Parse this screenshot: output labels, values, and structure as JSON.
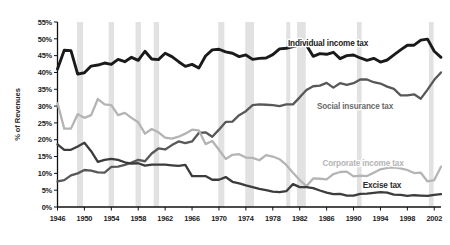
{
  "chart_data": {
    "type": "line",
    "title": "",
    "xlabel": "",
    "ylabel": "% of Revenues",
    "xlim": [
      1946,
      2003
    ],
    "ylim": [
      0,
      55
    ],
    "ytick_labels": [
      "0%",
      "5%",
      "10%",
      "15%",
      "20%",
      "25%",
      "30%",
      "35%",
      "40%",
      "45%",
      "50%",
      "55%"
    ],
    "ytick_values": [
      0,
      5,
      10,
      15,
      20,
      25,
      30,
      35,
      40,
      45,
      50,
      55
    ],
    "xtick_labels": [
      "1946",
      "1950",
      "1954",
      "1958",
      "1962",
      "1966",
      "1970",
      "1974",
      "1978",
      "1982",
      "1986",
      "1990",
      "1994",
      "1998",
      "2002"
    ],
    "xtick_values": [
      1946,
      1950,
      1954,
      1958,
      1962,
      1966,
      1970,
      1974,
      1978,
      1982,
      1986,
      1990,
      1994,
      1998,
      2002
    ],
    "grid": false,
    "legend_position": "inline-labels",
    "shaded_bands_label": "recession",
    "shaded_bands": [
      [
        1948.9,
        1949.8
      ],
      [
        1953.6,
        1954.4
      ],
      [
        1957.6,
        1958.4
      ],
      [
        1960.3,
        1961.1
      ],
      [
        1969.9,
        1970.8
      ],
      [
        1973.9,
        1975.2
      ],
      [
        1980.0,
        1980.6
      ],
      [
        1981.6,
        1982.9
      ],
      [
        1990.5,
        1991.2
      ],
      [
        2001.2,
        2001.9
      ]
    ],
    "x": [
      1946,
      1947,
      1948,
      1949,
      1950,
      1951,
      1952,
      1953,
      1954,
      1955,
      1956,
      1957,
      1958,
      1959,
      1960,
      1961,
      1962,
      1963,
      1964,
      1965,
      1966,
      1967,
      1968,
      1969,
      1970,
      1971,
      1972,
      1973,
      1974,
      1975,
      1976,
      1977,
      1978,
      1979,
      1980,
      1981,
      1982,
      1983,
      1984,
      1985,
      1986,
      1987,
      1988,
      1989,
      1990,
      1991,
      1992,
      1993,
      1994,
      1995,
      1996,
      1997,
      1998,
      1999,
      2000,
      2001,
      2002,
      2003
    ],
    "series": [
      {
        "name": "Individual income tax",
        "color": "#1a1a1a",
        "values": [
          41.0,
          46.6,
          46.5,
          39.5,
          39.9,
          41.9,
          42.2,
          42.8,
          42.4,
          43.9,
          43.2,
          44.5,
          43.6,
          46.3,
          44.0,
          43.8,
          45.7,
          44.7,
          43.2,
          41.8,
          42.4,
          41.3,
          44.9,
          46.7,
          46.9,
          46.1,
          45.7,
          44.7,
          45.2,
          43.9,
          44.2,
          44.3,
          45.3,
          47.0,
          47.2,
          47.7,
          48.2,
          48.1,
          44.8,
          45.6,
          45.4,
          46.0,
          44.1,
          45.0,
          45.2,
          44.3,
          43.6,
          44.2,
          43.1,
          43.7,
          45.2,
          46.7,
          48.1,
          48.1,
          49.6,
          49.9,
          46.3,
          44.5
        ]
      },
      {
        "name": "Social insurance tax",
        "color": "#585858",
        "values": [
          7.6,
          8.0,
          9.4,
          10.0,
          11.0,
          10.8,
          10.3,
          10.2,
          11.9,
          12.0,
          12.5,
          13.2,
          14.0,
          13.6,
          15.9,
          17.4,
          17.1,
          18.4,
          19.5,
          19.0,
          19.5,
          22.0,
          22.2,
          20.9,
          23.0,
          25.3,
          25.4,
          27.3,
          28.5,
          30.3,
          30.5,
          30.4,
          30.3,
          30.0,
          30.5,
          30.5,
          32.6,
          34.8,
          35.9,
          36.1,
          36.9,
          35.5,
          36.8,
          36.3,
          36.8,
          37.9,
          37.9,
          37.1,
          36.7,
          35.8,
          35.1,
          33.2,
          33.2,
          33.5,
          32.2,
          34.9,
          37.8,
          40.0
        ]
      },
      {
        "name": "Corporate income tax",
        "color": "#b4b4b4",
        "values": [
          30.9,
          23.3,
          23.3,
          27.6,
          26.5,
          27.3,
          32.1,
          30.5,
          30.3,
          27.3,
          28.0,
          26.5,
          25.2,
          21.8,
          23.2,
          22.2,
          20.6,
          20.3,
          20.9,
          21.8,
          23.0,
          22.8,
          18.7,
          19.6,
          17.0,
          14.3,
          15.5,
          15.7,
          14.7,
          14.6,
          13.9,
          15.4,
          15.0,
          14.2,
          12.5,
          10.2,
          8.0,
          6.2,
          8.5,
          8.4,
          8.2,
          9.8,
          10.4,
          10.5,
          9.1,
          9.3,
          9.2,
          10.2,
          11.2,
          11.6,
          11.8,
          11.5,
          11.0,
          10.1,
          10.2,
          7.6,
          8.0,
          12.0
        ]
      },
      {
        "name": "Excise tax",
        "color": "#3c3c3c",
        "values": [
          18.6,
          17.0,
          17.0,
          18.0,
          19.1,
          16.6,
          13.4,
          14.0,
          14.3,
          14.0,
          13.3,
          12.9,
          13.0,
          12.3,
          12.6,
          12.6,
          12.6,
          12.4,
          12.2,
          12.5,
          9.2,
          9.2,
          9.2,
          8.1,
          8.1,
          8.9,
          7.5,
          7.0,
          6.4,
          5.9,
          5.4,
          5.0,
          4.6,
          4.4,
          4.7,
          6.8,
          5.9,
          5.9,
          5.6,
          4.9,
          4.3,
          3.8,
          3.9,
          3.4,
          3.4,
          3.9,
          4.0,
          4.2,
          4.4,
          4.3,
          3.7,
          3.6,
          3.3,
          3.5,
          3.4,
          3.3,
          3.6,
          3.8
        ]
      }
    ],
    "annotations": [
      {
        "text": "Individual income tax",
        "series": "Individual income tax",
        "x": 328,
        "y": 46,
        "color": "#1a1a1a"
      },
      {
        "text": "Social insurance tax",
        "series": "Social insurance tax",
        "x": 355,
        "y": 109,
        "color": "#6a6a6a"
      },
      {
        "text": "Corporate income tax",
        "series": "Corporate income tax",
        "x": 363,
        "y": 166,
        "color": "#b4b4b4"
      },
      {
        "text": "Excise tax",
        "series": "Excise tax",
        "x": 382,
        "y": 188,
        "color": "#2b2b2b"
      }
    ]
  }
}
